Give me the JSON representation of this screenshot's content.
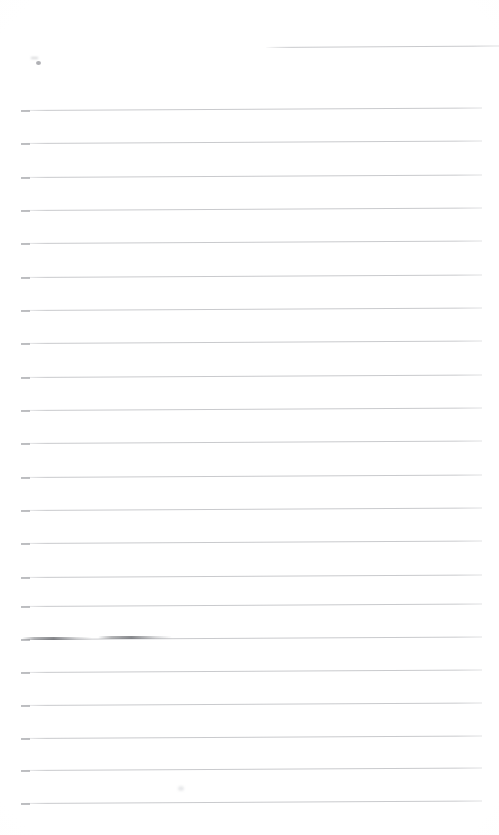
{
  "document": {
    "kind": "scanned-lined-notebook-page",
    "title": "",
    "visible_text": "",
    "background_color": "#ffffff",
    "rule_color": "#c9cacd",
    "rule_cap_color": "#a9abaf",
    "page": {
      "width": 499,
      "height": 835
    }
  },
  "ruled_lines": [
    {
      "index": 1,
      "y": 47,
      "x_start": 266,
      "x_end": 499,
      "skew_deg": -0.35,
      "cap": false,
      "note": "short header rule, right half only"
    },
    {
      "index": 2,
      "y": 110,
      "x_start": 21,
      "x_end": 482,
      "skew_deg": -0.32,
      "cap": true,
      "note": ""
    },
    {
      "index": 3,
      "y": 143,
      "x_start": 21,
      "x_end": 482,
      "skew_deg": -0.32,
      "cap": true,
      "note": ""
    },
    {
      "index": 4,
      "y": 177,
      "x_start": 21,
      "x_end": 482,
      "skew_deg": -0.32,
      "cap": true,
      "note": ""
    },
    {
      "index": 5,
      "y": 210,
      "x_start": 21,
      "x_end": 482,
      "skew_deg": -0.32,
      "cap": true,
      "note": ""
    },
    {
      "index": 6,
      "y": 243,
      "x_start": 21,
      "x_end": 482,
      "skew_deg": -0.32,
      "cap": true,
      "note": ""
    },
    {
      "index": 7,
      "y": 277,
      "x_start": 21,
      "x_end": 482,
      "skew_deg": -0.32,
      "cap": true,
      "note": ""
    },
    {
      "index": 8,
      "y": 310,
      "x_start": 21,
      "x_end": 482,
      "skew_deg": -0.32,
      "cap": true,
      "note": ""
    },
    {
      "index": 9,
      "y": 343,
      "x_start": 21,
      "x_end": 482,
      "skew_deg": -0.32,
      "cap": true,
      "note": ""
    },
    {
      "index": 10,
      "y": 377,
      "x_start": 21,
      "x_end": 482,
      "skew_deg": -0.32,
      "cap": true,
      "note": ""
    },
    {
      "index": 11,
      "y": 410,
      "x_start": 21,
      "x_end": 482,
      "skew_deg": -0.32,
      "cap": true,
      "note": ""
    },
    {
      "index": 12,
      "y": 443,
      "x_start": 21,
      "x_end": 482,
      "skew_deg": -0.32,
      "cap": true,
      "note": ""
    },
    {
      "index": 13,
      "y": 477,
      "x_start": 21,
      "x_end": 482,
      "skew_deg": -0.32,
      "cap": true,
      "note": ""
    },
    {
      "index": 14,
      "y": 510,
      "x_start": 21,
      "x_end": 482,
      "skew_deg": -0.32,
      "cap": true,
      "note": ""
    },
    {
      "index": 15,
      "y": 543,
      "x_start": 21,
      "x_end": 482,
      "skew_deg": -0.32,
      "cap": true,
      "note": ""
    },
    {
      "index": 16,
      "y": 577,
      "x_start": 21,
      "x_end": 482,
      "skew_deg": -0.32,
      "cap": true,
      "note": ""
    },
    {
      "index": 17,
      "y": 606,
      "x_start": 21,
      "x_end": 482,
      "skew_deg": -0.32,
      "cap": true,
      "note": ""
    },
    {
      "index": 18,
      "y": 639,
      "x_start": 21,
      "x_end": 482,
      "skew_deg": -0.32,
      "cap": true,
      "note": "carries a graphite smudge on its left half"
    },
    {
      "index": 19,
      "y": 672,
      "x_start": 21,
      "x_end": 482,
      "skew_deg": -0.32,
      "cap": true,
      "note": ""
    },
    {
      "index": 20,
      "y": 705,
      "x_start": 21,
      "x_end": 482,
      "skew_deg": -0.32,
      "cap": true,
      "note": ""
    },
    {
      "index": 21,
      "y": 738,
      "x_start": 21,
      "x_end": 482,
      "skew_deg": -0.32,
      "cap": true,
      "note": ""
    },
    {
      "index": 22,
      "y": 770,
      "x_start": 21,
      "x_end": 482,
      "skew_deg": -0.32,
      "cap": true,
      "note": ""
    },
    {
      "index": 23,
      "y": 803,
      "x_start": 21,
      "x_end": 482,
      "skew_deg": -0.32,
      "cap": true,
      "note": ""
    }
  ],
  "marks": [
    {
      "type": "pencil-dot",
      "x": 36,
      "y": 61,
      "width": 5,
      "height": 4
    },
    {
      "type": "pencil-tick",
      "x": 31,
      "y": 57,
      "width": 7,
      "height": 2
    },
    {
      "type": "smudge",
      "x": 22,
      "y": 637,
      "width": 70,
      "height": 3
    },
    {
      "type": "smudge",
      "x": 98,
      "y": 636,
      "width": 74,
      "height": 3
    },
    {
      "type": "speck",
      "x": 178,
      "y": 786,
      "width": 6,
      "height": 5
    }
  ]
}
